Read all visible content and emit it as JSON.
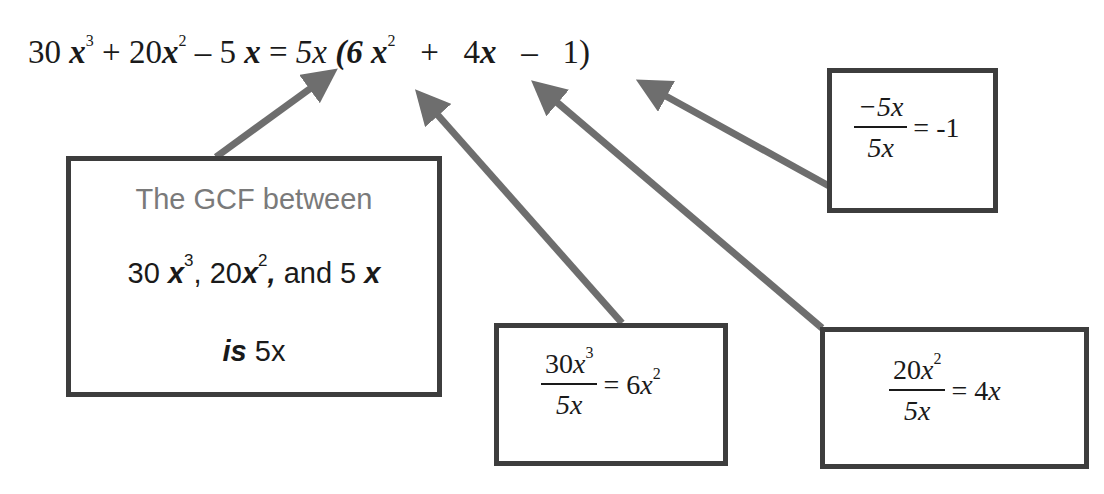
{
  "equation": {
    "lhs": [
      {
        "coef": "30 ",
        "var": "x",
        "exp": "3"
      },
      {
        "op": " + "
      },
      {
        "coef": "20",
        "var": "x",
        "exp": "2"
      },
      {
        "op": " – "
      },
      {
        "coef": "5 ",
        "var": "x",
        "exp": ""
      }
    ],
    "equals": " = ",
    "gcf": "5x",
    "open_paren": " (6 ",
    "term1_var": "x",
    "term1_exp": "2",
    "plus": "   +   ",
    "term2_coef": "4",
    "term2_var": "x",
    "minus": "   –   ",
    "term3": "1)"
  },
  "gcf_box": {
    "line1": "The GCF between",
    "line2": {
      "t1_coef": "30 ",
      "t1_var": "x",
      "t1_exp": "3",
      "sep1": ", ",
      "t2_coef": "20",
      "t2_var": "x",
      "t2_exp": "2",
      "sep2": ",",
      "and": " and 5 ",
      "t3_var": "x"
    },
    "line3_is": "is",
    "line3_value": " 5x"
  },
  "division_boxes": [
    {
      "numerator_coef": "30",
      "numerator_var": "x",
      "numerator_exp": "3",
      "denominator": "5x",
      "result_coef": "= 6",
      "result_var": "x",
      "result_exp": "2"
    },
    {
      "numerator_coef": "20",
      "numerator_var": "x",
      "numerator_exp": "2",
      "denominator": "5x",
      "result_coef": "= 4",
      "result_var": "x",
      "result_exp": ""
    },
    {
      "numerator_coef": "−5",
      "numerator_var": "x",
      "numerator_exp": "",
      "denominator": "5x",
      "result_coef": "= -1",
      "result_var": "",
      "result_exp": ""
    }
  ],
  "colors": {
    "arrow": "#6e6e6e",
    "box_border": "#3d3d3d",
    "text": "#1a1a1a",
    "gcf_heading": "#7a7a7a"
  }
}
